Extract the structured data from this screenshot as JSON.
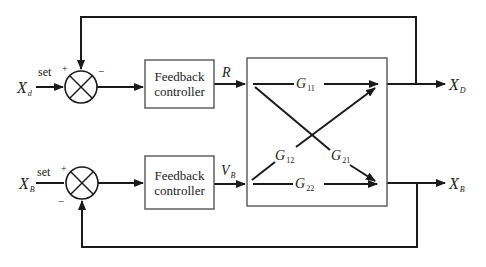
{
  "diagram": {
    "inputs": {
      "top": {
        "symbol": "X",
        "subscript": "d",
        "set_label": "set",
        "plus": "+",
        "minus": "−"
      },
      "bottom": {
        "symbol": "X",
        "subscript": "B",
        "set_label": "set",
        "plus": "+",
        "minus": "−"
      }
    },
    "controllers": {
      "top": {
        "line1": "Feedback",
        "line2": "controller",
        "output_symbol": "R",
        "output_subscript": ""
      },
      "bottom": {
        "line1": "Feedback",
        "line2": "controller",
        "output_symbol": "V",
        "output_subscript": "B"
      }
    },
    "process": {
      "g11": {
        "symbol": "G",
        "subscript": "11"
      },
      "g12": {
        "symbol": "G",
        "subscript": "12"
      },
      "g21": {
        "symbol": "G",
        "subscript": "21"
      },
      "g22": {
        "symbol": "G",
        "subscript": "22"
      }
    },
    "outputs": {
      "top": {
        "symbol": "X",
        "subscript": "D"
      },
      "bottom": {
        "symbol": "X",
        "subscript": "B"
      }
    },
    "colors": {
      "line": "#1a1a1a",
      "box": "#555555",
      "background": "#ffffff"
    }
  }
}
